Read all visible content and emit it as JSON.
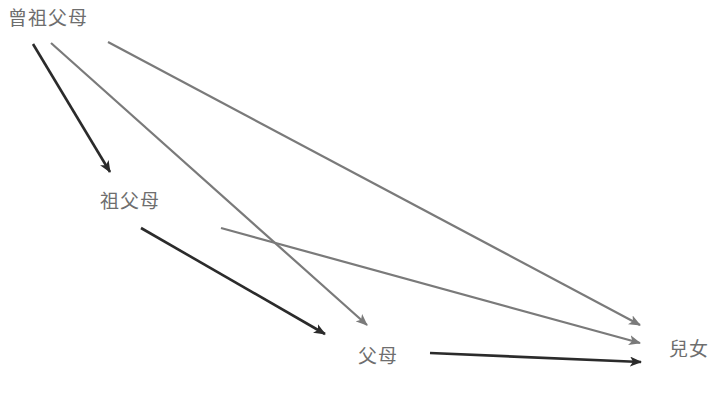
{
  "diagram": {
    "nodes": [
      {
        "id": "great-grandparents",
        "label": "曾祖父母",
        "x": 8,
        "y": 9
      },
      {
        "id": "grandparents",
        "label": "祖父母",
        "x": 100,
        "y": 192
      },
      {
        "id": "parents",
        "label": "父母",
        "x": 358,
        "y": 347
      },
      {
        "id": "children",
        "label": "兒女",
        "x": 669,
        "y": 340
      }
    ],
    "edges": [
      {
        "from": "great-grandparents",
        "to": "grandparents",
        "style": "dark",
        "x1": 33,
        "y1": 44,
        "x2": 110,
        "y2": 172
      },
      {
        "from": "great-grandparents",
        "to": "parents",
        "style": "gray",
        "x1": 51,
        "y1": 43,
        "x2": 367,
        "y2": 325
      },
      {
        "from": "great-grandparents",
        "to": "children",
        "style": "gray",
        "x1": 108,
        "y1": 42,
        "x2": 640,
        "y2": 325
      },
      {
        "from": "grandparents",
        "to": "parents",
        "style": "dark",
        "x1": 141,
        "y1": 228,
        "x2": 325,
        "y2": 334
      },
      {
        "from": "grandparents",
        "to": "children",
        "style": "gray",
        "x1": 221,
        "y1": 228,
        "x2": 640,
        "y2": 343
      },
      {
        "from": "parents",
        "to": "children",
        "style": "dark",
        "x1": 430,
        "y1": 353,
        "x2": 641,
        "y2": 362
      }
    ],
    "colors": {
      "dark": "#2b2b2b",
      "gray": "#7a7a7a",
      "label": "#6e6e6e"
    }
  }
}
